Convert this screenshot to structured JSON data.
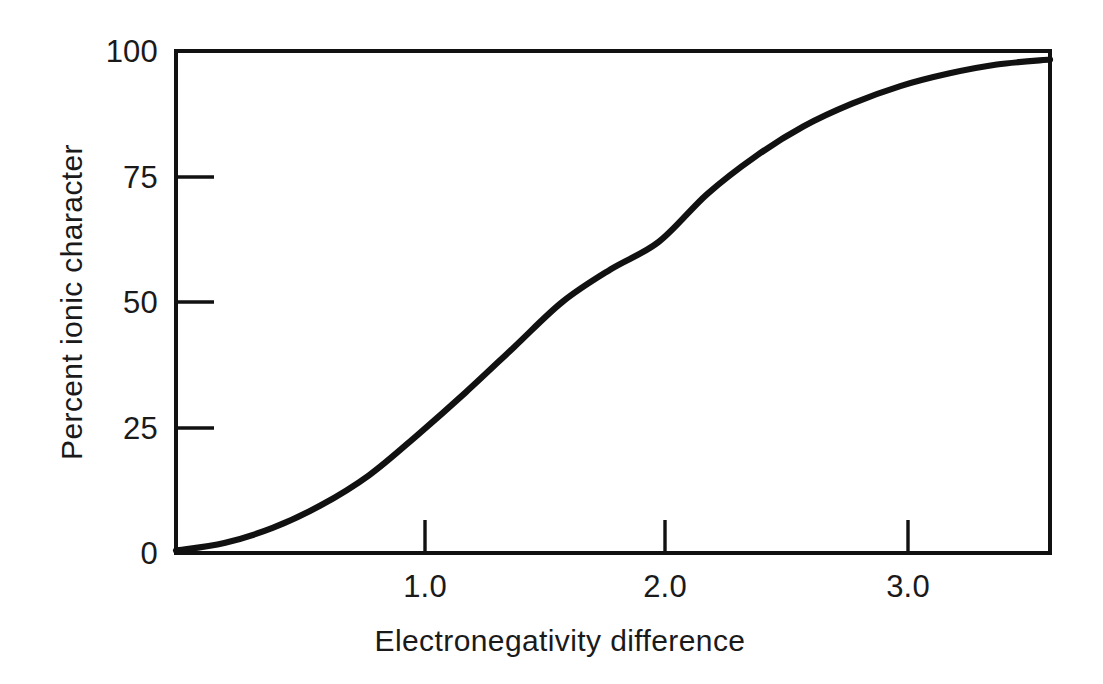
{
  "chart_data": {
    "type": "line",
    "title": "",
    "subtitle": "",
    "xlabel": "Electronegativity difference",
    "ylabel": "Percent ionic character",
    "xlim": [
      0.0,
      3.62
    ],
    "ylim": [
      0,
      100
    ],
    "grid": false,
    "legend": null,
    "xticks": [
      1.0,
      2.0,
      3.0
    ],
    "xtick_labels": [
      "1.0",
      "2.0",
      "3.0"
    ],
    "yticks": [
      0,
      25,
      50,
      75,
      100
    ],
    "ytick_labels": [
      "0",
      "25",
      "50",
      "75",
      "100"
    ],
    "series": [
      {
        "name": "Percent ionic character vs electronegativity difference",
        "x": [
          0.0,
          0.2,
          0.4,
          0.6,
          0.8,
          1.0,
          1.2,
          1.4,
          1.6,
          1.8,
          2.0,
          2.2,
          2.4,
          2.6,
          2.8,
          3.0,
          3.2,
          3.4,
          3.62
        ],
        "y": [
          0.5,
          2.0,
          5.0,
          9.5,
          15.5,
          23.5,
          32.0,
          41.0,
          50.0,
          56.5,
          62.0,
          71.5,
          79.0,
          85.0,
          89.5,
          93.0,
          95.5,
          97.3,
          98.3
        ]
      }
    ],
    "annotations": []
  },
  "axes": {
    "x_title": "Electronegativity difference",
    "y_title": "Percent ionic character",
    "x_tick_labels": [
      "1.0",
      "2.0",
      "3.0"
    ],
    "y_tick_labels": [
      "100",
      "75",
      "50",
      "25",
      "0"
    ]
  },
  "colors": {
    "background": "#ffffff",
    "curve": "#111111",
    "axis": "#111111",
    "text": "#1a1a1a"
  }
}
